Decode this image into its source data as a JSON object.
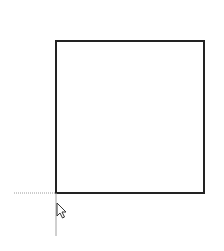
{
  "canvas": {
    "background": "#ffffff",
    "shape": {
      "type": "rectangle",
      "x": 56,
      "y": 41,
      "width": 148,
      "height": 152,
      "stroke": "#222222",
      "stroke_width": 2
    },
    "snap_guides": {
      "color": "#9a9a9a",
      "horizontal": {
        "x1": 14,
        "x2": 56,
        "y": 193
      },
      "vertical": {
        "x": 56,
        "y1": 193,
        "y2": 236
      }
    },
    "cursor": {
      "icon": "arrow-cursor-icon",
      "x": 57,
      "y": 203
    }
  }
}
